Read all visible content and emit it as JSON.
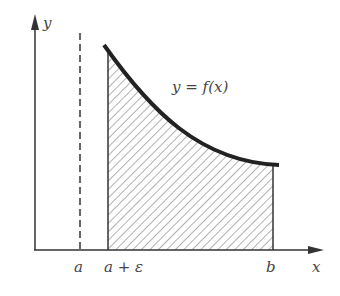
{
  "diagram": {
    "axes": {
      "x_label": "x",
      "y_label": "y"
    },
    "tick_labels": {
      "a": "a",
      "a_eps": "a + ε",
      "b": "b"
    },
    "curve_label": "y = f(x)",
    "colors": {
      "ink": "#222222",
      "hatch": "#555555",
      "text": "#444444"
    }
  }
}
